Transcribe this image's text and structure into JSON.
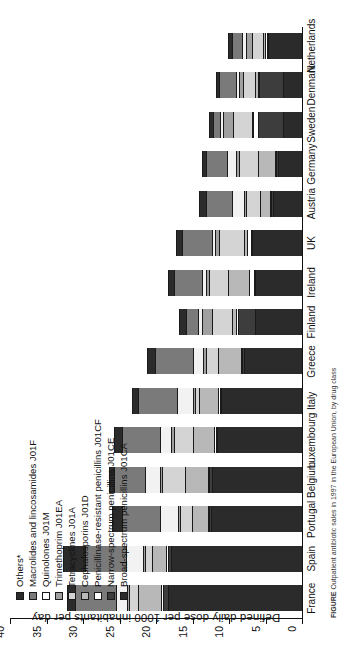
{
  "chart_data": {
    "type": "bar",
    "subtype": "stacked-bar",
    "title": "",
    "xlabel": "",
    "ylabel": "Defined daily dose per 1000 inhabitants per day",
    "ylim": [
      0,
      40
    ],
    "yticks": [
      0,
      5,
      10,
      15,
      20,
      25,
      30,
      35,
      40
    ],
    "grid": false,
    "orientation": "rotated-90-ccw",
    "legend_position": "upper-left",
    "categories": [
      "France",
      "Spain",
      "Portugal",
      "Belgium",
      "Luxembourg",
      "Italy",
      "Greece",
      "Finland",
      "Ireland",
      "UK",
      "Austria",
      "Germany",
      "Sweden",
      "Denmark",
      "Netherlands"
    ],
    "series": [
      {
        "name": "Broad-spectrum penicillins J01CA",
        "color": "#2b2b2b",
        "values": [
          18.4,
          18.0,
          12.4,
          12.3,
          11.6,
          11.1,
          8.0,
          6.5,
          6.4,
          6.8,
          4.0,
          3.3,
          2.6,
          2.6,
          4.6
        ]
      },
      {
        "name": "Narrow-spectrum penicillins J01CE",
        "color": "#3d3d3d",
        "values": [
          0.7,
          0.4,
          0.3,
          0.4,
          0.2,
          0.2,
          0.2,
          2.3,
          0.2,
          0.2,
          0.2,
          0.2,
          3.4,
          3.3,
          0.2
        ]
      },
      {
        "name": "Penicillinase-resistant penicillins J01CF",
        "color": "#ffffff",
        "values": [
          0.2,
          0.2,
          0.2,
          0.2,
          0.2,
          0.2,
          0.2,
          0.2,
          0.6,
          0.5,
          0.2,
          0.2,
          0.7,
          0.2,
          0.3
        ]
      },
      {
        "name": "Cephalosporins J01D",
        "color": "#b8b8b8",
        "values": [
          3.2,
          1.9,
          2.2,
          3.2,
          3.0,
          2.6,
          3.1,
          0.6,
          3.0,
          0.4,
          1.4,
          2.4,
          0.2,
          0.3,
          0.3
        ]
      },
      {
        "name": "Tetracyclines J01A",
        "color": "#d4d4d4",
        "values": [
          1.2,
          1.0,
          1.6,
          3.1,
          2.6,
          0.5,
          1.7,
          2.8,
          2.6,
          3.5,
          1.9,
          2.6,
          2.6,
          1.7,
          1.5
        ]
      },
      {
        "name": "Trimethoprim J01EA",
        "color": "#a0a0a0",
        "values": [
          0.3,
          0.3,
          0.3,
          0.3,
          0.3,
          0.3,
          0.3,
          1.3,
          0.4,
          0.5,
          0.3,
          0.3,
          1.3,
          0.5,
          0.8
        ]
      },
      {
        "name": "Quinolones J01M",
        "color": "#f2f2f2",
        "values": [
          1.5,
          2.3,
          2.5,
          2.0,
          1.5,
          2.3,
          1.5,
          0.6,
          0.5,
          0.4,
          1.6,
          1.3,
          0.4,
          0.4,
          0.5
        ]
      },
      {
        "name": "Macrolides and lincosamides J01F",
        "color": "#7a7a7a",
        "values": [
          5.6,
          5.6,
          5.1,
          4.3,
          5.3,
          5.3,
          5.1,
          1.6,
          3.8,
          4.1,
          3.6,
          2.8,
          1.0,
          2.4,
          1.4
        ]
      },
      {
        "name": "Others*",
        "color": "#2b2b2b",
        "values": [
          1.1,
          3.1,
          1.4,
          0.7,
          1.1,
          0.8,
          1.2,
          1.0,
          0.9,
          0.9,
          0.9,
          0.6,
          0.5,
          0.4,
          0.5
        ]
      }
    ],
    "totals": [
      32.2,
      32.8,
      26.0,
      26.5,
      25.8,
      23.3,
      21.3,
      16.9,
      18.4,
      17.3,
      14.1,
      13.7,
      12.7,
      11.8,
      10.1
    ]
  },
  "legend": {
    "items": [
      {
        "label": "Others*",
        "swatch": "#2b2b2b"
      },
      {
        "label": "Macrolides and lincosamides J01F",
        "swatch": "#7a7a7a"
      },
      {
        "label": "Quinolones J01M",
        "swatch": "#ffffff"
      },
      {
        "label": "Trimethoprim J01EA",
        "swatch": "#a0a0a0"
      },
      {
        "label": "Tetracyclines J01A",
        "swatch": "#d4d4d4"
      },
      {
        "label": "Cephalosporins J01D",
        "swatch": "#b8b8b8"
      },
      {
        "label": "Penicillinase-resistant penicillins J01CF",
        "swatch": "#ffffff"
      },
      {
        "label": "Narrow-spectrum penicillins J01CE",
        "swatch": "#3d3d3d"
      },
      {
        "label": "Broad-spectrum penicillins J01CA",
        "swatch": "#2b2b2b"
      }
    ]
  },
  "caption": {
    "figure_label": "FIGURE",
    "text": "Outpatient antibiotic sales in 1997 in the European Union, by drug class"
  }
}
